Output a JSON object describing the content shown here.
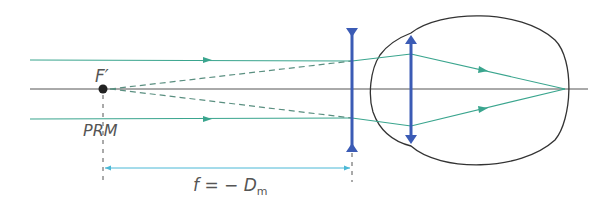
{
  "diagram": {
    "labels": {
      "focal_point": "F′",
      "far_point": "PRM",
      "formula_f": "f = − D",
      "formula_sub": "m"
    },
    "colors": {
      "ray": "#3aa58e",
      "lens": "#3b5bb5",
      "axis": "#444444",
      "outline": "#333333",
      "dimension": "#4bb8d6"
    }
  }
}
